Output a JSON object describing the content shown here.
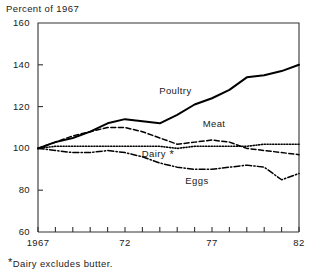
{
  "chart_data": {
    "type": "line",
    "title": "",
    "ylabel": "Percent of 1967",
    "xlabel": "",
    "ylim": [
      60,
      160
    ],
    "xlim": [
      1967,
      1982
    ],
    "grid": false,
    "legend_position": "inline-annotations",
    "y_ticks": [
      160,
      140,
      120,
      100,
      80,
      60
    ],
    "y_tick_labels": [
      "160",
      "140",
      "120",
      "100",
      "80",
      "60"
    ],
    "x_ticks": [
      1967,
      1968,
      1969,
      1970,
      1971,
      1972,
      1973,
      1974,
      1975,
      1976,
      1977,
      1978,
      1979,
      1980,
      1981,
      1982
    ],
    "x_tick_labels": [
      "1967",
      "",
      "",
      "",
      "",
      "72",
      "",
      "",
      "",
      "",
      "77",
      "",
      "",
      "",
      "",
      "82"
    ],
    "x": [
      1967,
      1968,
      1969,
      1970,
      1971,
      1972,
      1973,
      1974,
      1975,
      1976,
      1977,
      1978,
      1979,
      1980,
      1981,
      1982
    ],
    "series": [
      {
        "name": "Poultry",
        "style": "solid",
        "values": [
          100,
          103,
          105,
          108,
          112,
          114,
          113,
          112,
          116,
          121,
          124,
          128,
          134,
          135,
          137,
          140
        ]
      },
      {
        "name": "Meat",
        "style": "dashed",
        "values": [
          100,
          103,
          106,
          108,
          110,
          110,
          108,
          105,
          102,
          103,
          104,
          103,
          100,
          99,
          98,
          97
        ]
      },
      {
        "name": "Dairy",
        "style": "dotted",
        "values": [
          100,
          101,
          101,
          101,
          101,
          101,
          101,
          101,
          100,
          101,
          101,
          101,
          101,
          102,
          102,
          102
        ]
      },
      {
        "name": "Eggs",
        "style": "dashdot",
        "values": [
          100,
          99,
          98,
          98,
          99,
          98,
          96,
          93,
          91,
          90,
          90,
          91,
          92,
          91,
          85,
          88
        ]
      }
    ],
    "annotations": [
      {
        "text": "Poultry",
        "x": 1975.0,
        "y": 127
      },
      {
        "text": "Meat",
        "x": 1977.5,
        "y": 111
      },
      {
        "text": "Dairy",
        "x": 1974.0,
        "y": 97,
        "suffix": "*"
      },
      {
        "text": "Eggs",
        "x": 1976.5,
        "y": 84
      }
    ],
    "footnote": "Dairy excludes butter.",
    "footnote_marker": "*",
    "colors": {
      "line": "#000000",
      "axis": "#333333",
      "text": "#1a1a1a",
      "background": "#ffffff"
    }
  }
}
